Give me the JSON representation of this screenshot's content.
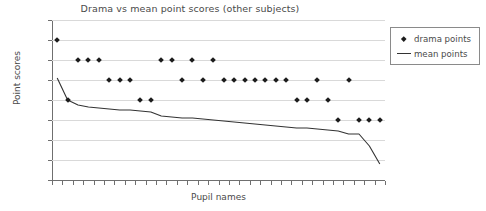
{
  "chart_data": {
    "type": "scatter",
    "title": "Drama vs mean point scores (other subjects)",
    "xlabel": "Pupil names",
    "ylabel": "Point scores",
    "ylim": [
      0,
      8
    ],
    "ytick_labels": [
      "8",
      "7",
      "6",
      "5",
      "4",
      "3",
      "2",
      "1",
      "0"
    ],
    "ytick_values": [
      8,
      7,
      6,
      5,
      4,
      3,
      2,
      1,
      0
    ],
    "grid": true,
    "legend_position": "right",
    "n_categories": 32,
    "categories_note": "Pupil names (unlabeled tick marks)",
    "series": [
      {
        "name": "drama points",
        "type": "scatter",
        "marker": "diamond",
        "color": "#1c1c1c",
        "x_index": [
          1,
          2,
          3,
          4,
          5,
          6,
          7,
          8,
          9,
          10,
          11,
          12,
          13,
          14,
          15,
          16,
          17,
          18,
          19,
          20,
          21,
          22,
          23,
          24,
          25,
          26,
          27,
          28,
          29,
          30,
          31,
          32
        ],
        "values": [
          7,
          4,
          6,
          6,
          6,
          5,
          5,
          5,
          4,
          4,
          6,
          6,
          5,
          6,
          5,
          6,
          5,
          5,
          5,
          5,
          5,
          5,
          5,
          4,
          4,
          5,
          4,
          3,
          5,
          3,
          3,
          3
        ]
      },
      {
        "name": "mean points",
        "type": "line",
        "color": "#333333",
        "x_index": [
          1,
          2,
          3,
          4,
          5,
          6,
          7,
          8,
          9,
          10,
          11,
          12,
          13,
          14,
          15,
          16,
          17,
          18,
          19,
          20,
          21,
          22,
          23,
          24,
          25,
          26,
          27,
          28,
          29,
          30,
          31,
          32
        ],
        "values": [
          5.1,
          4.0,
          3.75,
          3.65,
          3.6,
          3.55,
          3.5,
          3.5,
          3.45,
          3.4,
          3.2,
          3.15,
          3.1,
          3.1,
          3.05,
          3.0,
          2.95,
          2.9,
          2.85,
          2.8,
          2.75,
          2.7,
          2.65,
          2.6,
          2.6,
          2.55,
          2.5,
          2.45,
          2.3,
          2.3,
          1.7,
          0.8
        ]
      }
    ]
  },
  "legend": {
    "items": [
      {
        "label": "drama points",
        "key": "diamond-marker"
      },
      {
        "label": "mean points",
        "key": "line-marker"
      }
    ]
  },
  "colors": {
    "marker": "#1c1c1c",
    "line": "#333333",
    "grid": "#d9d9d9",
    "axis": "#6f6f6f",
    "text": "#4a4a4a",
    "background": "#ffffff"
  }
}
